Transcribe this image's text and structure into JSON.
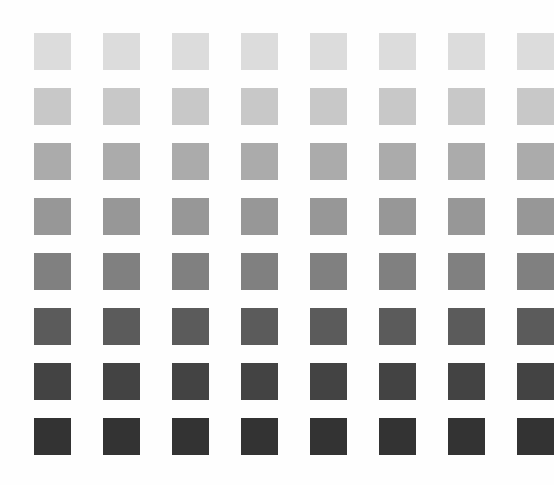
{
  "page": {
    "background_color": "#FEFEFE",
    "width": 549,
    "height": 485
  },
  "grid": {
    "rows": 8,
    "columns": 8,
    "swatch_size": 37,
    "column_pitch": 69,
    "row_pitch": 55,
    "origin_x": 34,
    "origin_y": 33,
    "description": "8 by 8 grid of solid square color swatches arranged as a grayscale step wedge, lightest at the top row and darkest at the bottom row; all swatches within a row share the same tone."
  },
  "chart_data": {
    "type": "heatmap",
    "xlabel": "",
    "ylabel": "",
    "grid": false,
    "legend_position": "none",
    "categories": [
      "C1",
      "C2",
      "C3",
      "C4",
      "C5",
      "C6",
      "C7",
      "C8"
    ],
    "row_labels": [
      "R1",
      "R2",
      "R3",
      "R4",
      "R5",
      "R6",
      "R7",
      "R8"
    ],
    "colorscale": "grayscale",
    "row_colors": [
      "#DCDCDC",
      "#C8C8C8",
      "#ABABAB",
      "#979797",
      "#808080",
      "#5B5B5B",
      "#434343",
      "#333333"
    ],
    "row_luminance": [
      220,
      200,
      171,
      151,
      128,
      91,
      67,
      51
    ],
    "values": [
      [
        220,
        220,
        220,
        220,
        220,
        220,
        220,
        220
      ],
      [
        200,
        200,
        200,
        200,
        200,
        200,
        200,
        200
      ],
      [
        171,
        171,
        171,
        171,
        171,
        171,
        171,
        171
      ],
      [
        151,
        151,
        151,
        151,
        151,
        151,
        151,
        151
      ],
      [
        128,
        128,
        128,
        128,
        128,
        128,
        128,
        128
      ],
      [
        91,
        91,
        91,
        91,
        91,
        91,
        91,
        91
      ],
      [
        67,
        67,
        67,
        67,
        67,
        67,
        67,
        67
      ],
      [
        51,
        51,
        51,
        51,
        51,
        51,
        51,
        51
      ]
    ],
    "zlim": [
      0,
      255
    ]
  }
}
